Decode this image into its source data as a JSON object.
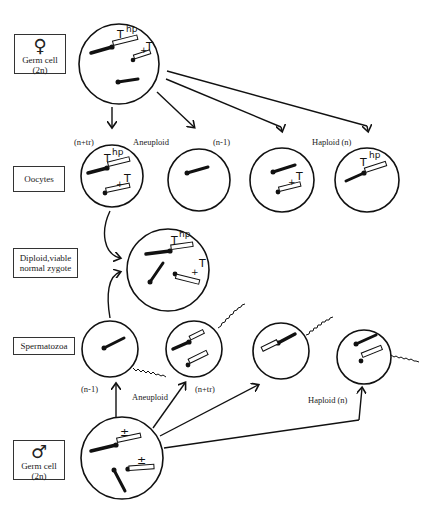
{
  "row_labels": {
    "female_germ": {
      "symbol": "♀",
      "line1": "Germ cell",
      "line2": "(2n)"
    },
    "oocytes": {
      "label": "Oocytes"
    },
    "zygote": {
      "line1": "Diploid,viable",
      "line2": "normal zygote"
    },
    "spermatozoa": {
      "label": "Spermatozoa"
    },
    "male_germ": {
      "symbol": "♂",
      "line1": "Germ cell",
      "line2": "(2n)"
    }
  },
  "oocyte_captions": {
    "n_plus_tr": "(n+tr)",
    "aneuploid": "Aneuploid",
    "n_minus_1": "(n-1)",
    "haploid": "Haploid  (n)"
  },
  "sperm_captions": {
    "n_minus_1": "(n-1)",
    "aneuploid": "Aneuploid",
    "n_plus_tr": "(n+tr)",
    "haploid": "Haploid  (n)"
  },
  "gene_labels": {
    "T": "T",
    "hp": "hp",
    "plus": "+",
    "plus_minus": "±"
  }
}
